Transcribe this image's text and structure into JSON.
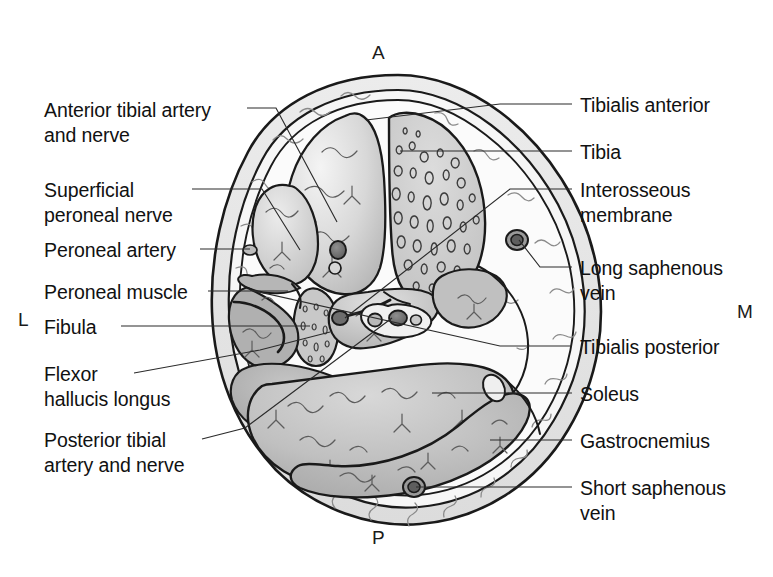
{
  "figure": {
    "orientation_markers": [
      {
        "id": "anterior",
        "text": "A",
        "x": 372,
        "y": 43
      },
      {
        "id": "posterior",
        "text": "P",
        "x": 372,
        "y": 528
      },
      {
        "id": "lateral",
        "text": "L",
        "x": 18,
        "y": 310
      },
      {
        "id": "medial",
        "text": "M",
        "x": 737,
        "y": 302
      }
    ],
    "colors": {
      "background": "#ffffff",
      "text": "#111111",
      "leader_line": "#2b2b2b",
      "outline": "#1a1a1a",
      "skin_layer": "#e8e8e8",
      "subcutaneous_fat": "#dedede",
      "deep_fascia": "#f7f7f7",
      "muscle_light": "#f0f0f0",
      "muscle_mid": "#c9c9c9",
      "muscle_dark": "#a8a8a8",
      "bone_fill": "#d2d2d2",
      "vessel_dark": "#6f6f6f",
      "vessel_mid": "#9a9a9a"
    }
  },
  "labels_left": [
    {
      "id": "anterior-tibial-artery-and-nerve",
      "lines": [
        "Anterior tibial artery",
        "and nerve"
      ],
      "x": 44,
      "y": 98,
      "leader": {
        "x1": 247,
        "y1": 108,
        "x2": 276,
        "y2": 108,
        "x3": 337,
        "y3": 222
      }
    },
    {
      "id": "superficial-peroneal-nerve",
      "lines": [
        "Superficial",
        "peroneal nerve"
      ],
      "x": 44,
      "y": 178,
      "leader": {
        "x1": 192,
        "y1": 189,
        "x2": 262,
        "y2": 189,
        "x3": 300,
        "y3": 250
      }
    },
    {
      "id": "peroneal-artery",
      "lines": [
        "Peroneal artery"
      ],
      "x": 44,
      "y": 238,
      "leader": {
        "x1": 200,
        "y1": 249,
        "x2": 248,
        "y2": 249,
        "x3": 250,
        "y3": 249
      }
    },
    {
      "id": "peroneal-muscle",
      "lines": [
        "Peroneal muscle"
      ],
      "x": 44,
      "y": 280,
      "leader": {
        "x1": 208,
        "y1": 291,
        "x2": 288,
        "y2": 291,
        "x3": 288,
        "y3": 291
      }
    },
    {
      "id": "fibula",
      "lines": [
        "Fibula"
      ],
      "x": 44,
      "y": 315,
      "leader": {
        "x1": 121,
        "y1": 326,
        "x2": 310,
        "y2": 326,
        "x3": 310,
        "y3": 326
      }
    },
    {
      "id": "flexor-hallucis-longus",
      "lines": [
        "Flexor",
        "hallucis longus"
      ],
      "x": 44,
      "y": 362,
      "leader": {
        "x1": 134,
        "y1": 373,
        "x2": 260,
        "y2": 350,
        "x3": 330,
        "y3": 332
      }
    },
    {
      "id": "posterior-tibial-artery-and-nerve",
      "lines": [
        "Posterior tibial",
        "artery and nerve"
      ],
      "x": 44,
      "y": 428,
      "leader": {
        "x1": 202,
        "y1": 439,
        "x2": 245,
        "y2": 428,
        "x3": 392,
        "y3": 318
      }
    }
  ],
  "labels_right": [
    {
      "id": "tibialis-anterior",
      "lines": [
        "Tibialis anterior"
      ],
      "x": 580,
      "y": 93,
      "leader": {
        "x1": 572,
        "y1": 104,
        "x2": 500,
        "y2": 104,
        "x3": 366,
        "y3": 120
      }
    },
    {
      "id": "tibia",
      "lines": [
        "Tibia"
      ],
      "x": 580,
      "y": 140,
      "leader": {
        "x1": 572,
        "y1": 151,
        "x2": 490,
        "y2": 151,
        "x3": 400,
        "y3": 151
      }
    },
    {
      "id": "interosseous-membrane",
      "lines": [
        "Interosseous",
        "membrane"
      ],
      "x": 580,
      "y": 178,
      "leader": {
        "x1": 572,
        "y1": 189,
        "x2": 510,
        "y2": 189,
        "x3": 345,
        "y3": 318
      }
    },
    {
      "id": "long-saphenous-vein",
      "lines": [
        "Long saphenous",
        "vein"
      ],
      "x": 580,
      "y": 256,
      "leader": {
        "x1": 572,
        "y1": 267,
        "x2": 540,
        "y2": 267,
        "x3": 519,
        "y3": 240
      }
    },
    {
      "id": "tibialis-posterior",
      "lines": [
        "Tibialis posterior"
      ],
      "x": 580,
      "y": 335,
      "leader": {
        "x1": 572,
        "y1": 346,
        "x2": 500,
        "y2": 346,
        "x3": 250,
        "y3": 290
      }
    },
    {
      "id": "soleus",
      "lines": [
        "Soleus"
      ],
      "x": 580,
      "y": 382,
      "leader": {
        "x1": 572,
        "y1": 393,
        "x2": 480,
        "y2": 393,
        "x3": 432,
        "y3": 393
      }
    },
    {
      "id": "gastrocnemius",
      "lines": [
        "Gastrocnemius"
      ],
      "x": 580,
      "y": 429,
      "leader": {
        "x1": 572,
        "y1": 440,
        "x2": 500,
        "y2": 440,
        "x3": 490,
        "y3": 440
      }
    },
    {
      "id": "short-saphenous-vein",
      "lines": [
        "Short saphenous",
        "vein"
      ],
      "x": 580,
      "y": 476,
      "leader": {
        "x1": 572,
        "y1": 487,
        "x2": 440,
        "y2": 487,
        "x3": 416,
        "y3": 487
      }
    }
  ]
}
